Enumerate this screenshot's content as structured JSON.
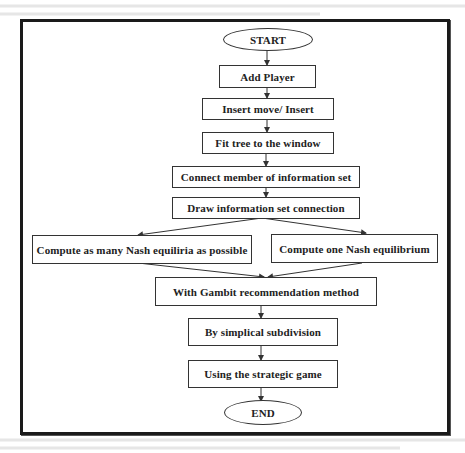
{
  "flowchart": {
    "start": "START",
    "end": "END",
    "steps": [
      "Add Player",
      "Insert move/ Insert",
      "Fit tree to the window",
      "Connect member of information set",
      "Draw information set connection"
    ],
    "branches": [
      "Compute as many Nash equiliria as possible",
      "Compute one Nash equilibrium"
    ],
    "after_branches": [
      "With Gambit recommendation method",
      "By simplical subdivision",
      "Using the strategic game"
    ]
  },
  "colors": {
    "line": "#333333",
    "frame": "#1a1a1a",
    "text": "#222222",
    "background": "#ffffff"
  }
}
